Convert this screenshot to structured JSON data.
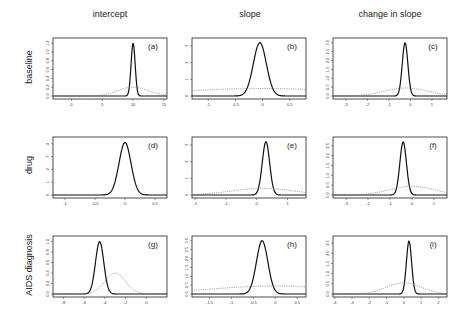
{
  "columns": [
    "intercept",
    "slope",
    "change in slope"
  ],
  "rows": [
    "baseline",
    "drug",
    "AIDS diagnosis"
  ],
  "chart_data": [
    {
      "id": "a",
      "label": "(a)",
      "type": "line",
      "row": "baseline",
      "column": "intercept",
      "xlim": [
        -3,
        15.5
      ],
      "xticks": [
        0,
        5,
        10,
        15
      ],
      "ylim": [
        0,
        1.25
      ],
      "yticks": [
        0.0,
        0.2,
        0.4,
        0.6,
        0.8,
        1.0,
        1.2
      ],
      "series": [
        {
          "name": "posterior",
          "style": "solid",
          "mean": 10,
          "sd": 0.33,
          "peak": 1.2
        },
        {
          "name": "prior",
          "style": "dotted",
          "mean": 10,
          "sd": 2.5,
          "peak": 0.2
        }
      ]
    },
    {
      "id": "b",
      "label": "(b)",
      "type": "line",
      "row": "baseline",
      "column": "slope",
      "xlim": [
        -1.3,
        0.8
      ],
      "xticks": [
        -1.0,
        -0.5,
        0.0,
        0.5
      ],
      "ylim": [
        0,
        3.3
      ],
      "yticks": [
        0,
        1,
        2,
        3
      ],
      "series": [
        {
          "name": "posterior",
          "style": "solid",
          "mean": -0.05,
          "sd": 0.12,
          "peak": 3.2
        },
        {
          "name": "prior",
          "style": "dotted",
          "mean": 0,
          "sd": 1.6,
          "peak": 0.45
        }
      ]
    },
    {
      "id": "c",
      "label": "(c)",
      "type": "line",
      "row": "baseline",
      "column": "change in slope",
      "xlim": [
        -3.6,
        1.7
      ],
      "xticks": [
        -3,
        -2,
        -1,
        0,
        1
      ],
      "ylim": [
        0,
        3.1
      ],
      "yticks": [
        0.0,
        0.5,
        1.0,
        1.5,
        2.0,
        2.5,
        3.0
      ],
      "series": [
        {
          "name": "posterior",
          "style": "solid",
          "mean": -0.25,
          "sd": 0.13,
          "peak": 3.0
        },
        {
          "name": "prior",
          "style": "dotted",
          "mean": -0.2,
          "sd": 1.0,
          "peak": 0.45
        }
      ]
    },
    {
      "id": "d",
      "label": "(d)",
      "type": "line",
      "row": "drug",
      "column": "intercept",
      "xlim": [
        -1.2,
        0.7
      ],
      "xticks": [
        -1.0,
        -0.5,
        0.0,
        0.5
      ],
      "ylim": [
        0,
        4.3
      ],
      "yticks": [
        0,
        1,
        2,
        3,
        4
      ],
      "series": [
        {
          "name": "posterior",
          "style": "solid",
          "mean": 0.0,
          "sd": 0.1,
          "peak": 4.1
        }
      ]
    },
    {
      "id": "e",
      "label": "(e)",
      "type": "line",
      "row": "drug",
      "column": "slope",
      "xlim": [
        -2.1,
        1.6
      ],
      "xticks": [
        -2,
        -1,
        0,
        1
      ],
      "ylim": [
        0,
        3.3
      ],
      "yticks": [
        0,
        1,
        2,
        3
      ],
      "series": [
        {
          "name": "posterior",
          "style": "solid",
          "mean": 0.3,
          "sd": 0.12,
          "peak": 3.2
        },
        {
          "name": "prior",
          "style": "dotted",
          "mean": 0.2,
          "sd": 1.0,
          "peak": 0.4
        }
      ]
    },
    {
      "id": "f",
      "label": "(f)",
      "type": "line",
      "row": "drug",
      "column": "change in slope",
      "xlim": [
        -3.6,
        1.6
      ],
      "xticks": [
        -3,
        -2,
        -1,
        0,
        1
      ],
      "ylim": [
        0,
        2.8
      ],
      "yticks": [
        0.0,
        0.5,
        1.0,
        1.5,
        2.0,
        2.5
      ],
      "series": [
        {
          "name": "posterior",
          "style": "solid",
          "mean": -0.4,
          "sd": 0.15,
          "peak": 2.7
        },
        {
          "name": "prior",
          "style": "dotted",
          "mean": 0,
          "sd": 1.0,
          "peak": 0.45
        }
      ]
    },
    {
      "id": "g",
      "label": "(g)",
      "type": "line",
      "row": "AIDS diagnosis",
      "column": "intercept",
      "xlim": [
        -9,
        2
      ],
      "xticks": [
        -8,
        -6,
        -4,
        -2,
        0
      ],
      "ylim": [
        0,
        1.05
      ],
      "yticks": [
        0.0,
        0.2,
        0.4,
        0.6,
        0.8,
        1.0
      ],
      "series": [
        {
          "name": "posterior",
          "style": "solid",
          "mean": -4.5,
          "sd": 0.4,
          "peak": 1.0
        },
        {
          "name": "prior",
          "style": "dotted",
          "mean": -3.0,
          "sd": 1.0,
          "peak": 0.4
        }
      ]
    },
    {
      "id": "h",
      "label": "(h)",
      "type": "line",
      "row": "AIDS diagnosis",
      "column": "slope",
      "xlim": [
        -1.9,
        0.7
      ],
      "xticks": [
        -1.5,
        -1.0,
        -0.5,
        0.0,
        0.5
      ],
      "ylim": [
        0,
        3.1
      ],
      "yticks": [
        0.0,
        0.5,
        1.0,
        1.5,
        2.0,
        2.5,
        3.0
      ],
      "series": [
        {
          "name": "posterior",
          "style": "solid",
          "mean": -0.3,
          "sd": 0.13,
          "peak": 3.0
        },
        {
          "name": "prior",
          "style": "dotted",
          "mean": 0,
          "sd": 1.5,
          "peak": 0.45
        }
      ]
    },
    {
      "id": "i",
      "label": "(i)",
      "type": "line",
      "row": "AIDS diagnosis",
      "column": "change in slope",
      "xlim": [
        -4.1,
        2.5
      ],
      "xticks": [
        -4,
        -3,
        -2,
        -1,
        0,
        1,
        2
      ],
      "ylim": [
        0,
        2.7
      ],
      "yticks": [
        0.0,
        0.5,
        1.0,
        1.5,
        2.0,
        2.5
      ],
      "series": [
        {
          "name": "posterior",
          "style": "solid",
          "mean": 0.3,
          "sd": 0.15,
          "peak": 2.6
        },
        {
          "name": "prior",
          "style": "dotted",
          "mean": 0,
          "sd": 1.0,
          "peak": 0.55
        }
      ]
    }
  ]
}
